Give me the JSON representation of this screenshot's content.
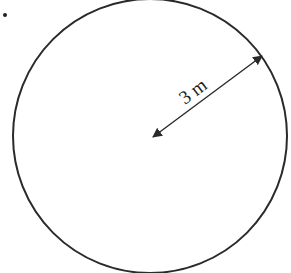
{
  "diagram": {
    "type": "circle-radius",
    "question_marker": ".",
    "circle": {
      "cx": 150,
      "cy": 136,
      "r": 137,
      "stroke": "#2a2a2a"
    },
    "radius_arrow": {
      "x1": 153,
      "y1": 137,
      "x2": 262,
      "y2": 56,
      "stroke": "#2a2a2a"
    },
    "label": "3 m",
    "colors": {
      "line": "#2a2a2a",
      "background": "#ffffff"
    }
  }
}
